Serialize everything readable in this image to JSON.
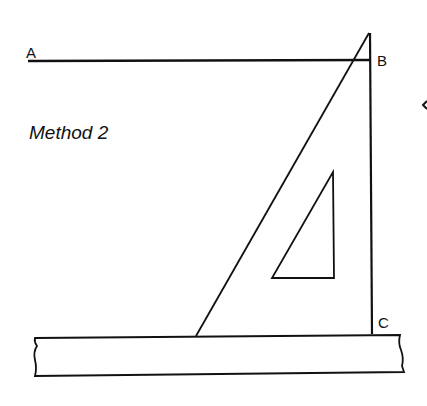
{
  "diagram": {
    "title": "Method 2",
    "labels": {
      "a": "A",
      "b": "B",
      "c": "C"
    },
    "colors": {
      "stroke": "#111111",
      "background": "#ffffff"
    },
    "elements": [
      {
        "name": "line-ab",
        "from": "A",
        "to": "B"
      },
      {
        "name": "line-bc",
        "from": "B",
        "to": "C",
        "perpendicular_to": "line-ab"
      },
      {
        "name": "set-square",
        "shape": "right-triangle with triangular cutout"
      },
      {
        "name": "straight-edge",
        "shape": "ruler with broken ends"
      }
    ]
  }
}
